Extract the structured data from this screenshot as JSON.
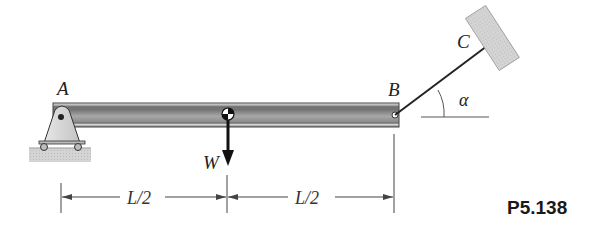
{
  "figure": {
    "id_label": "P5.138",
    "points": {
      "A": "A",
      "B": "B",
      "C": "C"
    },
    "load": {
      "label": "W",
      "direction": "down"
    },
    "angle": {
      "label": "α"
    },
    "dimensions": [
      {
        "label": "L/2",
        "from": "A",
        "to": "center"
      },
      {
        "label": "L/2",
        "from": "center",
        "to": "B"
      }
    ],
    "colors": {
      "beam_dark": "#5a5a5a",
      "beam_light": "#c8c8c8",
      "support_fill": "#d9d9d9",
      "wall_fill": "#cfcfcf",
      "line": "#333333"
    }
  }
}
